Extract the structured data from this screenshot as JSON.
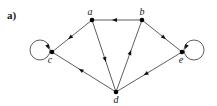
{
  "panel_label": "a)",
  "graph": {
    "directed": true,
    "nodes": [
      {
        "id": "a",
        "label": "a"
      },
      {
        "id": "b",
        "label": "b"
      },
      {
        "id": "c",
        "label": "c"
      },
      {
        "id": "d",
        "label": "d"
      },
      {
        "id": "e",
        "label": "e"
      }
    ],
    "edges": [
      {
        "from": "b",
        "to": "a"
      },
      {
        "from": "a",
        "to": "c"
      },
      {
        "from": "a",
        "to": "d"
      },
      {
        "from": "d",
        "to": "b"
      },
      {
        "from": "d",
        "to": "c"
      },
      {
        "from": "e",
        "to": "d"
      },
      {
        "from": "b",
        "to": "e"
      },
      {
        "from": "c",
        "to": "c",
        "self_loop": true
      },
      {
        "from": "e",
        "to": "e",
        "self_loop": true
      }
    ]
  },
  "colors": {
    "edge": "#333333",
    "node": "#000000",
    "text": "#1a1a1a"
  }
}
